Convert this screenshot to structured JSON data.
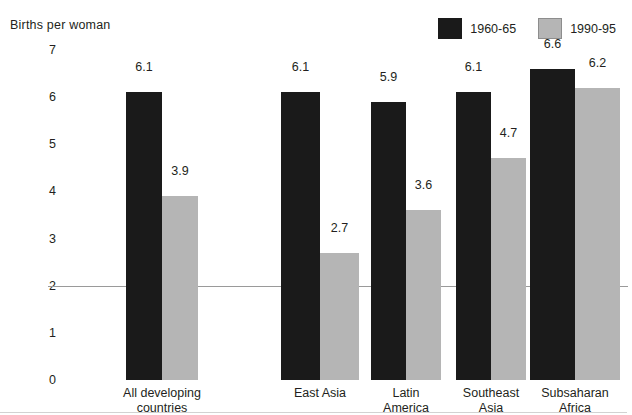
{
  "chart_data": {
    "type": "bar",
    "title": "Births per woman",
    "xlabel": "",
    "ylabel": "",
    "ylim": [
      0,
      7
    ],
    "yticks": [
      0,
      1,
      2,
      3,
      4,
      5,
      6,
      7
    ],
    "gridlines": [
      2
    ],
    "grid": "single horizontal line at 2",
    "legend_position": "top-right",
    "categories": [
      "All developing\ncountries",
      "East Asia",
      "Latin\nAmerica",
      "Southeast\nAsia",
      "Subsaharan\nAfrica"
    ],
    "series": [
      {
        "name": "1960-65",
        "color": "#1a1a1a",
        "values": [
          6.1,
          6.1,
          5.9,
          6.1,
          6.6
        ],
        "labels": [
          "6.1",
          "6.1",
          "5.9",
          "6.1",
          "6.6"
        ]
      },
      {
        "name": "1990-95",
        "color": "#b5b5b5",
        "values": [
          3.9,
          2.7,
          3.6,
          4.7,
          6.2
        ],
        "labels": [
          "3.9",
          "2.7",
          "3.6",
          "4.7",
          "6.2"
        ]
      }
    ]
  },
  "legend": {
    "items": [
      {
        "label": "1960-65",
        "swatch": "dark"
      },
      {
        "label": "1990-95",
        "swatch": "light"
      }
    ]
  },
  "yaxis": {
    "ticks": [
      "0",
      "1",
      "2",
      "3",
      "4",
      "5",
      "6",
      "7"
    ]
  },
  "colors": {
    "series_1960_65": "#1a1a1a",
    "series_1990_95": "#b5b5b5",
    "gridline": "#9a9a9a",
    "text": "#231f20",
    "background": "#ffffff"
  }
}
